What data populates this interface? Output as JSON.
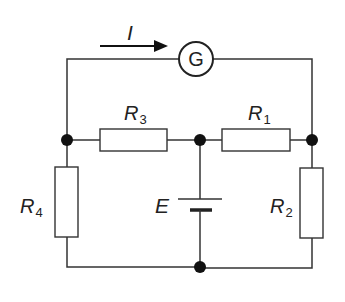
{
  "diagram": {
    "type": "circuit",
    "current": {
      "label": "I",
      "direction": "right"
    },
    "galvanometer": {
      "label": "G"
    },
    "resistors": [
      {
        "id": "R3",
        "symbol": "R",
        "subscript": "3",
        "position": "top-left horizontal"
      },
      {
        "id": "R1",
        "symbol": "R",
        "subscript": "1",
        "position": "top-right horizontal"
      },
      {
        "id": "R4",
        "symbol": "R",
        "subscript": "4",
        "position": "left vertical"
      },
      {
        "id": "R2",
        "symbol": "R",
        "subscript": "2",
        "position": "right vertical"
      }
    ],
    "source": {
      "label": "E",
      "type": "battery"
    },
    "junctions": 4
  },
  "colors": {
    "line": "#333333",
    "background": "#ffffff"
  }
}
